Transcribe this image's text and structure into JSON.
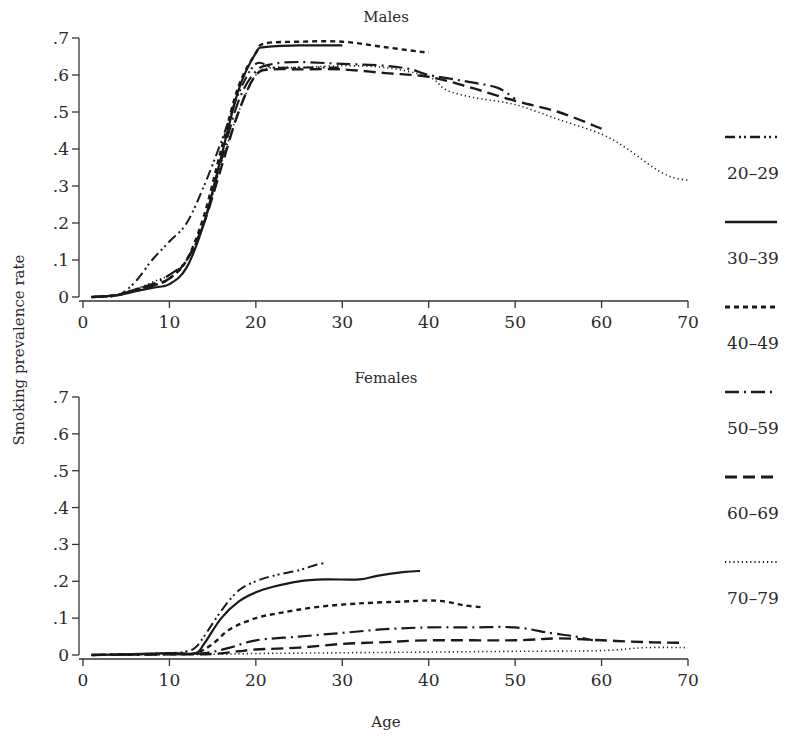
{
  "chart_data": [
    {
      "type": "line",
      "title": "Males",
      "xlabel": "Age",
      "ylabel": "Smoking prevalence rate",
      "xlim": [
        0,
        70
      ],
      "ylim": [
        0,
        0.7
      ],
      "xticks": [
        0,
        10,
        20,
        30,
        40,
        50,
        60,
        70
      ],
      "yticks": [
        0,
        0.1,
        0.2,
        0.3,
        0.4,
        0.5,
        0.6,
        0.7
      ],
      "ytick_labels": [
        "0",
        ".1",
        ".2",
        ".3",
        ".4",
        ".5",
        ".6",
        ".7"
      ],
      "grid": false,
      "series": [
        {
          "name": "20–29",
          "style": "dash-dot-dot",
          "points": [
            [
              1,
              0
            ],
            [
              4,
              0.005
            ],
            [
              6,
              0.04
            ],
            [
              8,
              0.1
            ],
            [
              10,
              0.15
            ],
            [
              12,
              0.2
            ],
            [
              14,
              0.3
            ],
            [
              16,
              0.42
            ],
            [
              18,
              0.55
            ],
            [
              20,
              0.63
            ],
            [
              22,
              0.62
            ],
            [
              25,
              0.62
            ],
            [
              28,
              0.62
            ],
            [
              30,
              0.62
            ]
          ]
        },
        {
          "name": "30–39",
          "style": "solid",
          "points": [
            [
              1,
              0
            ],
            [
              4,
              0.005
            ],
            [
              6,
              0.015
            ],
            [
              8,
              0.025
            ],
            [
              10,
              0.035
            ],
            [
              12,
              0.08
            ],
            [
              14,
              0.2
            ],
            [
              16,
              0.38
            ],
            [
              18,
              0.56
            ],
            [
              20,
              0.66
            ],
            [
              21,
              0.675
            ],
            [
              25,
              0.68
            ],
            [
              30,
              0.68
            ]
          ]
        },
        {
          "name": "40–49",
          "style": "short-dash",
          "points": [
            [
              1,
              0
            ],
            [
              4,
              0.005
            ],
            [
              6,
              0.02
            ],
            [
              8,
              0.03
            ],
            [
              10,
              0.05
            ],
            [
              12,
              0.1
            ],
            [
              14,
              0.22
            ],
            [
              16,
              0.4
            ],
            [
              18,
              0.57
            ],
            [
              20,
              0.66
            ],
            [
              21,
              0.685
            ],
            [
              25,
              0.69
            ],
            [
              30,
              0.69
            ],
            [
              35,
              0.675
            ],
            [
              40,
              0.66
            ]
          ]
        },
        {
          "name": "50–59",
          "style": "long-dash-dot",
          "points": [
            [
              1,
              0
            ],
            [
              4,
              0.005
            ],
            [
              6,
              0.02
            ],
            [
              8,
              0.035
            ],
            [
              10,
              0.06
            ],
            [
              12,
              0.1
            ],
            [
              14,
              0.2
            ],
            [
              16,
              0.37
            ],
            [
              18,
              0.53
            ],
            [
              20,
              0.61
            ],
            [
              22,
              0.63
            ],
            [
              25,
              0.635
            ],
            [
              30,
              0.63
            ],
            [
              35,
              0.625
            ],
            [
              38,
              0.615
            ],
            [
              40,
              0.6
            ],
            [
              45,
              0.58
            ],
            [
              48,
              0.565
            ],
            [
              50,
              0.535
            ]
          ]
        },
        {
          "name": "60–69",
          "style": "long-dash",
          "points": [
            [
              1,
              0
            ],
            [
              4,
              0.005
            ],
            [
              6,
              0.02
            ],
            [
              8,
              0.03
            ],
            [
              10,
              0.05
            ],
            [
              12,
              0.1
            ],
            [
              14,
              0.2
            ],
            [
              16,
              0.35
            ],
            [
              18,
              0.5
            ],
            [
              20,
              0.6
            ],
            [
              22,
              0.615
            ],
            [
              25,
              0.615
            ],
            [
              30,
              0.615
            ],
            [
              35,
              0.605
            ],
            [
              40,
              0.595
            ],
            [
              45,
              0.565
            ],
            [
              50,
              0.53
            ],
            [
              55,
              0.5
            ],
            [
              60,
              0.455
            ]
          ]
        },
        {
          "name": "70–79",
          "style": "dotted",
          "points": [
            [
              1,
              0
            ],
            [
              4,
              0.005
            ],
            [
              6,
              0.02
            ],
            [
              8,
              0.04
            ],
            [
              10,
              0.06
            ],
            [
              12,
              0.1
            ],
            [
              14,
              0.2
            ],
            [
              16,
              0.36
            ],
            [
              18,
              0.5
            ],
            [
              20,
              0.6
            ],
            [
              22,
              0.62
            ],
            [
              25,
              0.62
            ],
            [
              30,
              0.625
            ],
            [
              35,
              0.62
            ],
            [
              40,
              0.595
            ],
            [
              42,
              0.56
            ],
            [
              45,
              0.54
            ],
            [
              50,
              0.52
            ],
            [
              55,
              0.48
            ],
            [
              60,
              0.44
            ],
            [
              63,
              0.4
            ],
            [
              66,
              0.35
            ],
            [
              68,
              0.325
            ],
            [
              70,
              0.315
            ]
          ]
        }
      ]
    },
    {
      "type": "line",
      "title": "Females",
      "xlabel": "Age",
      "ylabel": "Smoking prevalence rate",
      "xlim": [
        0,
        70
      ],
      "ylim": [
        0,
        0.7
      ],
      "xticks": [
        0,
        10,
        20,
        30,
        40,
        50,
        60,
        70
      ],
      "yticks": [
        0,
        0.1,
        0.2,
        0.3,
        0.4,
        0.5,
        0.6,
        0.7
      ],
      "ytick_labels": [
        "0",
        ".1",
        ".2",
        ".3",
        ".4",
        ".5",
        ".6",
        ".7"
      ],
      "grid": false,
      "series": [
        {
          "name": "20–29",
          "style": "dash-dot-dot",
          "points": [
            [
              1,
              0
            ],
            [
              10,
              0.005
            ],
            [
              12,
              0.01
            ],
            [
              13,
              0.02
            ],
            [
              14,
              0.05
            ],
            [
              16,
              0.12
            ],
            [
              18,
              0.175
            ],
            [
              20,
              0.2
            ],
            [
              22,
              0.215
            ],
            [
              25,
              0.23
            ],
            [
              27,
              0.245
            ],
            [
              28,
              0.25
            ]
          ]
        },
        {
          "name": "30–39",
          "style": "solid",
          "points": [
            [
              1,
              0
            ],
            [
              10,
              0.005
            ],
            [
              13,
              0.005
            ],
            [
              14,
              0.03
            ],
            [
              16,
              0.1
            ],
            [
              18,
              0.145
            ],
            [
              20,
              0.17
            ],
            [
              22,
              0.185
            ],
            [
              25,
              0.2
            ],
            [
              28,
              0.205
            ],
            [
              32,
              0.205
            ],
            [
              34,
              0.215
            ],
            [
              37,
              0.225
            ],
            [
              39,
              0.228
            ]
          ]
        },
        {
          "name": "40–49",
          "style": "short-dash",
          "points": [
            [
              1,
              0
            ],
            [
              10,
              0.003
            ],
            [
              13,
              0.005
            ],
            [
              15,
              0.03
            ],
            [
              17,
              0.07
            ],
            [
              20,
              0.1
            ],
            [
              23,
              0.115
            ],
            [
              27,
              0.13
            ],
            [
              32,
              0.14
            ],
            [
              37,
              0.145
            ],
            [
              40,
              0.148
            ],
            [
              42,
              0.145
            ],
            [
              44,
              0.135
            ],
            [
              46,
              0.13
            ]
          ]
        },
        {
          "name": "50–59",
          "style": "long-dash-dot",
          "points": [
            [
              1,
              0
            ],
            [
              10,
              0.002
            ],
            [
              14,
              0.005
            ],
            [
              17,
              0.02
            ],
            [
              20,
              0.04
            ],
            [
              25,
              0.05
            ],
            [
              30,
              0.06
            ],
            [
              35,
              0.07
            ],
            [
              40,
              0.075
            ],
            [
              45,
              0.075
            ],
            [
              50,
              0.075
            ],
            [
              54,
              0.06
            ],
            [
              57,
              0.05
            ],
            [
              59,
              0.04
            ]
          ]
        },
        {
          "name": "60–69",
          "style": "long-dash",
          "points": [
            [
              1,
              0
            ],
            [
              10,
              0.002
            ],
            [
              15,
              0.003
            ],
            [
              18,
              0.01
            ],
            [
              20,
              0.015
            ],
            [
              25,
              0.02
            ],
            [
              30,
              0.03
            ],
            [
              35,
              0.035
            ],
            [
              40,
              0.04
            ],
            [
              50,
              0.04
            ],
            [
              55,
              0.045
            ],
            [
              60,
              0.04
            ],
            [
              65,
              0.035
            ],
            [
              69,
              0.033
            ]
          ]
        },
        {
          "name": "70–79",
          "style": "dotted",
          "points": [
            [
              1,
              0
            ],
            [
              15,
              0.002
            ],
            [
              20,
              0.004
            ],
            [
              30,
              0.006
            ],
            [
              40,
              0.008
            ],
            [
              50,
              0.01
            ],
            [
              60,
              0.012
            ],
            [
              65,
              0.02
            ],
            [
              70,
              0.02
            ]
          ]
        }
      ]
    }
  ],
  "labels": {
    "males_title": "Males",
    "females_title": "Females",
    "ylabel": "Smoking prevalence rate",
    "xlabel": "Age"
  },
  "legend": [
    {
      "name": "20–29",
      "style": "dash-dot-dot"
    },
    {
      "name": "30–39",
      "style": "solid"
    },
    {
      "name": "40–49",
      "style": "short-dash"
    },
    {
      "name": "50–59",
      "style": "long-dash-dot"
    },
    {
      "name": "60–69",
      "style": "long-dash"
    },
    {
      "name": "70–79",
      "style": "dotted"
    }
  ],
  "colors": {
    "ink": "#1a1a1a",
    "axis": "#333333",
    "background": "#ffffff"
  }
}
